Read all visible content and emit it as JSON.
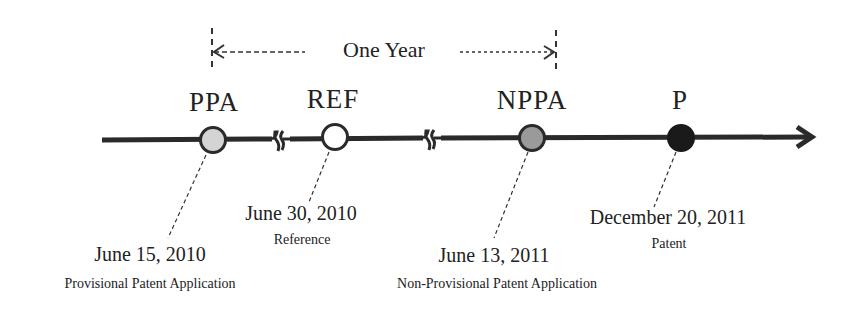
{
  "diagram": {
    "type": "timeline",
    "span": {
      "label": "One Year",
      "from_event": "PPA",
      "to_event": "NPPA"
    },
    "axis": {
      "color": "#2a2a2a",
      "breaks": [
        "between PPA and REF",
        "between REF and NPPA"
      ],
      "arrow": "right"
    },
    "events": [
      {
        "abbr": "PPA",
        "date": "June 15, 2010",
        "description": "Provisional Patent Application",
        "fill": "#d4d4d4"
      },
      {
        "abbr": "REF",
        "date": "June 30, 2010",
        "description": "Reference",
        "fill": "#ffffff"
      },
      {
        "abbr": "NPPA",
        "date": "June 13, 2011",
        "description": "Non-Provisional Patent Application",
        "fill": "#9a9a9a"
      },
      {
        "abbr": "P",
        "date": "December 20, 2011",
        "description": "Patent",
        "fill": "#1a1a1a"
      }
    ]
  }
}
